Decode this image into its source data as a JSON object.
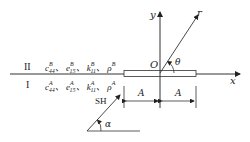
{
  "diagram": {
    "regions": [
      {
        "label": "II",
        "params": [
          {
            "sym": "c",
            "sup": "B",
            "sub": "44"
          },
          {
            "sym": "e",
            "sup": "B",
            "sub": "15"
          },
          {
            "sym": "k",
            "sup": "B",
            "sub": "11"
          },
          {
            "sym": "ρ",
            "sup": "B",
            "sub": ""
          }
        ]
      },
      {
        "label": "I",
        "params": [
          {
            "sym": "c",
            "sup": "A",
            "sub": "44"
          },
          {
            "sym": "e",
            "sup": "A",
            "sub": "15"
          },
          {
            "sym": "k",
            "sup": "A",
            "sub": "11"
          },
          {
            "sym": "ρ",
            "sup": "A",
            "sub": ""
          }
        ]
      }
    ],
    "separator": "、",
    "axes": {
      "x": "x",
      "y": "y",
      "origin": "O",
      "radial": "r",
      "angle": "θ"
    },
    "crack_half_length": [
      "A",
      "A"
    ],
    "incident_wave": {
      "label": "SH",
      "angle": "α"
    }
  }
}
